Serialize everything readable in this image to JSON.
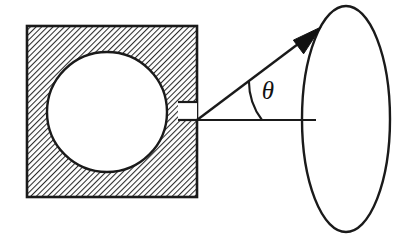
{
  "figure": {
    "kind": "physics-diagram",
    "background_color": "#ffffff",
    "ink_color": "#1a1a1a",
    "hatch_color": "#2b2b2b",
    "cavity_fill": "#ffffff",
    "aperture_fill": "#ffffff",
    "arrowhead_fill": "#111111"
  },
  "labels": {
    "theta": "θ"
  },
  "elements": {
    "hatched_block": {
      "name": "hatched-square-block",
      "x": 27,
      "y": 26,
      "width": 170,
      "height": 171,
      "hatch_angle_deg": 45,
      "hatch_spacing": 4
    },
    "cavity_circle": {
      "name": "circular-cavity",
      "cx": 107,
      "cy": 112,
      "r": 60
    },
    "aperture": {
      "name": "aperture-slit",
      "x": 178,
      "y": 102,
      "width": 19,
      "height": 18
    },
    "vertex": {
      "name": "aperture-vertex",
      "x": 197,
      "y": 120
    },
    "axis_ray": {
      "name": "normal-axis-ray",
      "x1": 197,
      "y1": 120,
      "x2": 316,
      "y2": 120
    },
    "emission_ray": {
      "name": "emission-ray",
      "x1": 197,
      "y1": 120,
      "x2": 314,
      "y2": 32
    },
    "arrowhead": {
      "name": "ray-arrowhead",
      "tip_x": 321,
      "tip_y": 27,
      "length": 30,
      "half_width": 11
    },
    "angle_arc": {
      "name": "theta-angle-arc",
      "cx": 197,
      "cy": 120,
      "radius": 65,
      "start_deg": 0,
      "end_deg": 37
    },
    "theta_text": {
      "name": "theta-symbol",
      "x": 268,
      "y": 99
    },
    "detector_ellipse": {
      "name": "detector-ellipse",
      "cx": 346,
      "cy": 119,
      "rx": 44,
      "ry": 113
    }
  }
}
